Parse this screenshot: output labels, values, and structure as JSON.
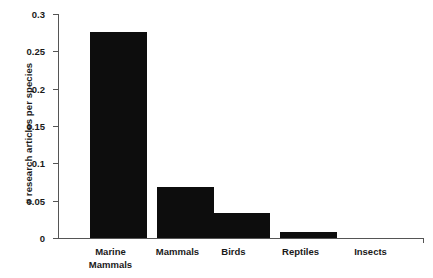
{
  "chart_data": {
    "type": "bar",
    "title": "",
    "xlabel": "",
    "ylabel": "# research articles per species",
    "categories": [
      "Marine\nMammals",
      "Mammals",
      "Birds",
      "Reptiles",
      "Insects"
    ],
    "category_labels_flat": [
      "Marine Mammals",
      "Mammals",
      "Birds",
      "Reptiles",
      "Insects"
    ],
    "values": [
      0.276,
      0.068,
      0.034,
      0.008,
      0.0
    ],
    "ylim": [
      0,
      0.3
    ],
    "yticks": [
      0,
      0.05,
      0.1,
      0.15,
      0.2,
      0.25,
      0.3
    ],
    "ytick_labels": [
      "0",
      "0.05",
      "0.1",
      "0.15",
      "0.2",
      "0.25",
      "0.3"
    ],
    "grid": false,
    "legend": null,
    "bar_color": "#0d0d0d",
    "axis_color": "#555555",
    "background": "#ffffff"
  }
}
